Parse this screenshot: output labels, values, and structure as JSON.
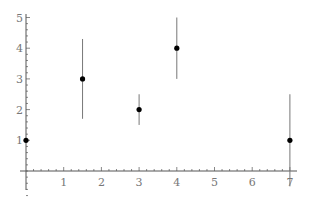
{
  "chart_data": {
    "type": "scatter",
    "title": "",
    "xlabel": "",
    "ylabel": "",
    "xlim": [
      0,
      7.2
    ],
    "ylim": [
      -0.9,
      5.2
    ],
    "grid": false,
    "legend": null,
    "x_ticks": [
      "1",
      "2",
      "3",
      "4",
      "5",
      "6",
      "7"
    ],
    "y_ticks": [
      "1",
      "2",
      "3",
      "4",
      "5"
    ],
    "points": [
      {
        "x": 0,
        "y": 1,
        "err_low": 1,
        "err_high": 1
      },
      {
        "x": 1.5,
        "y": 3,
        "err_low": 1.7,
        "err_high": 4.3
      },
      {
        "x": 3,
        "y": 2,
        "err_low": 1.5,
        "err_high": 2.5
      },
      {
        "x": 4,
        "y": 4,
        "err_low": 3,
        "err_high": 5
      },
      {
        "x": 7,
        "y": 1,
        "err_low": -0.5,
        "err_high": 2.5
      }
    ],
    "colors": {
      "axis": "#555555",
      "marker": "#000000",
      "errorbar": "#777777",
      "tick_label": "#777777"
    }
  }
}
